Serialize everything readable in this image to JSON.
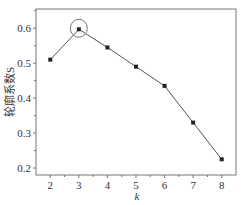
{
  "chart_data": {
    "type": "line",
    "title": "",
    "xlabel": "k",
    "ylabel": "轮廓系数S",
    "x": [
      2,
      3,
      4,
      5,
      6,
      7,
      8
    ],
    "series": [
      {
        "name": "轮廓系数S",
        "values": [
          0.51,
          0.597,
          0.545,
          0.49,
          0.435,
          0.33,
          0.225
        ]
      }
    ],
    "xlim": [
      1.5,
      8.5
    ],
    "ylim": [
      0.18,
      0.655
    ],
    "xticks": [
      2,
      3,
      4,
      5,
      6,
      7,
      8
    ],
    "yticks": [
      0.2,
      0.3,
      0.4,
      0.5,
      0.6
    ],
    "ytick_labels": [
      "0.2",
      "0.3",
      "0.4",
      "0.5",
      "0.6"
    ],
    "xtick_labels": [
      "2",
      "3",
      "4",
      "5",
      "6",
      "7",
      "8"
    ],
    "grid": false,
    "legend": null,
    "annotations": [
      {
        "type": "circle",
        "target_x": 3,
        "target_y": 0.597,
        "note": "optimal k highlighted"
      }
    ],
    "colors": {
      "line": "#555555",
      "marker": "#222222",
      "axis": "#777777"
    }
  }
}
